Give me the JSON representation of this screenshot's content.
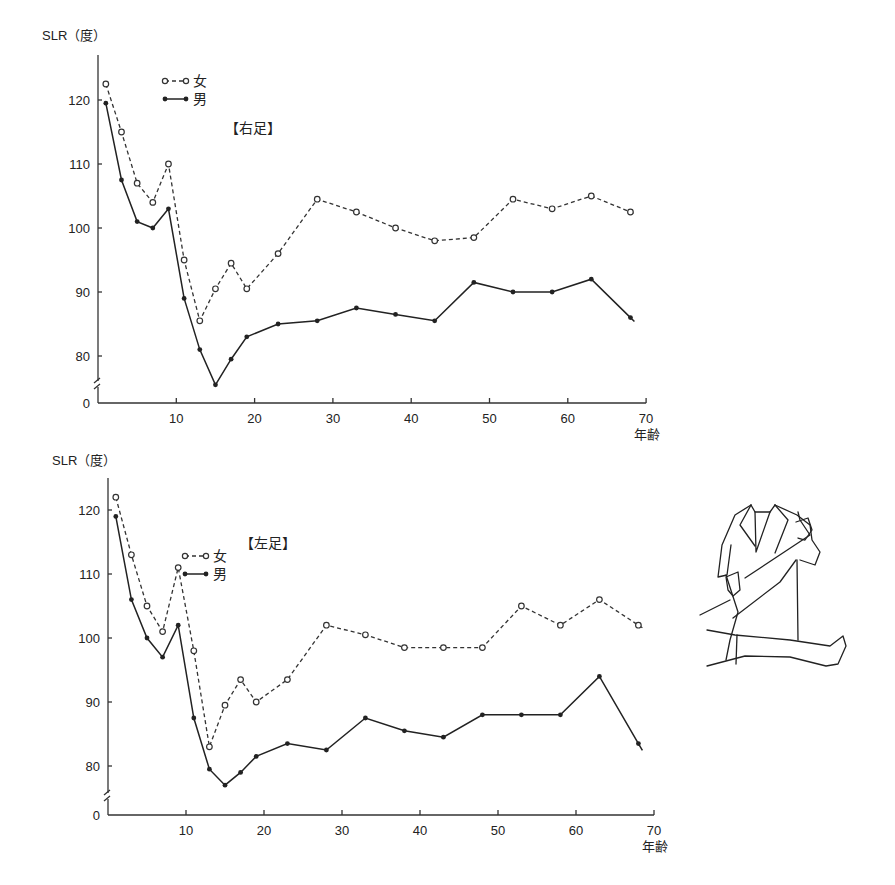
{
  "chart_data": [
    {
      "type": "line",
      "title": "【右足】",
      "ylabel": "SLR（度）",
      "xlabel": "年齢",
      "x_ticks": [
        10,
        20,
        30,
        40,
        50,
        60,
        70
      ],
      "y_ticks": [
        0,
        80,
        90,
        100,
        110,
        120
      ],
      "ylim": [
        0,
        125
      ],
      "axis_break": "between 0 and 80",
      "xlim": [
        0,
        70
      ],
      "legend": [
        "女",
        "男"
      ],
      "legend_position": "top-left",
      "grid": false,
      "x": [
        1,
        3,
        5,
        7,
        9,
        11,
        13,
        15,
        17,
        19,
        23,
        28,
        33,
        38,
        43,
        48,
        53,
        58,
        63,
        68
      ],
      "series": [
        {
          "name": "女",
          "style": "dashed, open circles",
          "values": [
            122.5,
            115,
            107,
            104,
            110,
            95,
            85.5,
            90.5,
            94.5,
            90.5,
            96,
            104.5,
            102.5,
            100,
            98,
            98.5,
            104.5,
            103,
            105,
            102.5
          ]
        },
        {
          "name": "男",
          "style": "solid, filled circles",
          "values": [
            119.5,
            107.5,
            101,
            100,
            103,
            89,
            81,
            75.5,
            79.5,
            83,
            85,
            85.5,
            87.5,
            86.5,
            85.5,
            91.5,
            90,
            90,
            92,
            86
          ]
        }
      ]
    },
    {
      "type": "line",
      "title": "【左足】",
      "ylabel": "SLR（度）",
      "xlabel": "年齢",
      "x_ticks": [
        10,
        20,
        30,
        40,
        50,
        60,
        70
      ],
      "y_ticks": [
        0,
        80,
        90,
        100,
        110,
        120
      ],
      "ylim": [
        0,
        125
      ],
      "axis_break": "between 0 and 80",
      "xlim": [
        0,
        70
      ],
      "legend": [
        "女",
        "男"
      ],
      "legend_position": "top-left",
      "grid": false,
      "x": [
        1,
        3,
        5,
        7,
        9,
        11,
        13,
        15,
        17,
        19,
        23,
        28,
        33,
        38,
        43,
        48,
        53,
        58,
        63,
        68
      ],
      "series": [
        {
          "name": "女",
          "style": "dashed, open circles",
          "values": [
            122,
            113,
            105,
            101,
            111,
            98,
            83,
            89.5,
            93.5,
            90,
            93.5,
            102,
            100.5,
            98.5,
            98.5,
            98.5,
            105,
            102,
            106,
            102
          ]
        },
        {
          "name": "男",
          "style": "solid, filled circles",
          "values": [
            119,
            106,
            100,
            97,
            102,
            87.5,
            79.5,
            77,
            79,
            81.5,
            83.5,
            82.5,
            87.5,
            85.5,
            84.5,
            88,
            88,
            88,
            94,
            83.5
          ]
        }
      ]
    }
  ],
  "charts": [
    {
      "ylabel": "SLR（度）",
      "title": "【右足】",
      "xlabel": "年齢",
      "legend": {
        "female": "女",
        "male": "男"
      },
      "y_tick_labels": [
        "0",
        "80",
        "90",
        "100",
        "110",
        "120"
      ],
      "x_tick_labels": [
        "10",
        "20",
        "30",
        "40",
        "50",
        "60",
        "70"
      ]
    },
    {
      "ylabel": "SLR（度）",
      "title": "【左足】",
      "xlabel": "年齢",
      "legend": {
        "female": "女",
        "male": "男"
      },
      "y_tick_labels": [
        "0",
        "80",
        "90",
        "100",
        "110",
        "120"
      ],
      "x_tick_labels": [
        "10",
        "20",
        "30",
        "40",
        "50",
        "60",
        "70"
      ]
    }
  ],
  "illustration": {
    "icon": "straight-leg-raise-test-illustration"
  }
}
